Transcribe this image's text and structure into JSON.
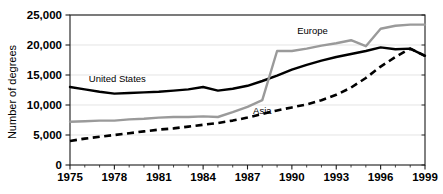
{
  "chart_data": {
    "type": "line",
    "title": "",
    "xlabel": "",
    "ylabel": "Number of degrees",
    "xlim": [
      1975,
      1999
    ],
    "ylim": [
      0,
      25000
    ],
    "grid": true,
    "legend_position": "inline-annotations",
    "x": [
      1975,
      1976,
      1977,
      1978,
      1979,
      1980,
      1981,
      1982,
      1983,
      1984,
      1985,
      1986,
      1987,
      1988,
      1989,
      1990,
      1991,
      1992,
      1993,
      1994,
      1995,
      1996,
      1997,
      1998,
      1999
    ],
    "xticks": [
      1975,
      1978,
      1981,
      1984,
      1987,
      1990,
      1993,
      1996,
      1999
    ],
    "xtick_labels": [
      "1975",
      "1978",
      "1981",
      "1984",
      "1987",
      "1990",
      "1993",
      "1996",
      "1999"
    ],
    "yticks": [
      0,
      5000,
      10000,
      15000,
      20000,
      25000
    ],
    "ytick_labels": [
      "0",
      "5,000",
      "10,000",
      "15,000",
      "20,000",
      "25,000"
    ],
    "series": [
      {
        "name": "United States",
        "style": "solid",
        "color": "#000000",
        "label_x": 1978.2,
        "label_y": 13900,
        "values": [
          13000,
          12600,
          12200,
          11900,
          12000,
          12100,
          12200,
          12400,
          12600,
          13000,
          12400,
          12700,
          13200,
          14000,
          14900,
          15900,
          16700,
          17400,
          18000,
          18500,
          19000,
          19600,
          19300,
          19400,
          18200
        ]
      },
      {
        "name": "Europe",
        "style": "solid",
        "color": "#9a9a9a",
        "label_x": 1991.4,
        "label_y": 21800,
        "values": [
          7200,
          7300,
          7400,
          7400,
          7600,
          7700,
          7900,
          8000,
          8000,
          8100,
          8000,
          8800,
          9700,
          10800,
          19000,
          19000,
          19400,
          19900,
          20300,
          20800,
          19800,
          22700,
          23200,
          23400,
          23400
        ]
      },
      {
        "name": "Asia",
        "style": "dashed",
        "color": "#000000",
        "label_x": 1988.0,
        "label_y": 8500,
        "values": [
          4000,
          4400,
          4700,
          5000,
          5300,
          5600,
          5900,
          6100,
          6400,
          6700,
          7000,
          7400,
          7900,
          8500,
          9100,
          9600,
          10100,
          10800,
          11700,
          12900,
          14500,
          16400,
          18000,
          19400,
          18200
        ]
      }
    ]
  }
}
